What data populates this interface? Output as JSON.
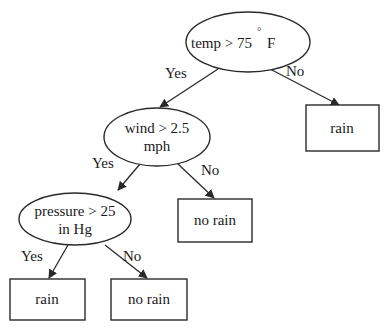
{
  "diagram": {
    "type": "decision-tree",
    "nodes": {
      "root": {
        "kind": "decision",
        "line1": "temp > 75",
        "degree": "°",
        "unit": "F"
      },
      "wind": {
        "kind": "decision",
        "line1": "wind > 2.5",
        "line2": "mph"
      },
      "pressure": {
        "kind": "decision",
        "line1": "pressure > 25",
        "line2": "in Hg"
      },
      "leaf_root_no": {
        "kind": "leaf",
        "label": "rain"
      },
      "leaf_wind_no": {
        "kind": "leaf",
        "label": "no rain"
      },
      "leaf_pressure_yes": {
        "kind": "leaf",
        "label": "rain"
      },
      "leaf_pressure_no": {
        "kind": "leaf",
        "label": "no rain"
      }
    },
    "edges": [
      {
        "from": "root",
        "to": "wind",
        "label": "Yes"
      },
      {
        "from": "root",
        "to": "leaf_root_no",
        "label": "No"
      },
      {
        "from": "wind",
        "to": "pressure",
        "label": "Yes"
      },
      {
        "from": "wind",
        "to": "leaf_wind_no",
        "label": "No"
      },
      {
        "from": "pressure",
        "to": "leaf_pressure_yes",
        "label": "Yes"
      },
      {
        "from": "pressure",
        "to": "leaf_pressure_no",
        "label": "No"
      }
    ]
  }
}
